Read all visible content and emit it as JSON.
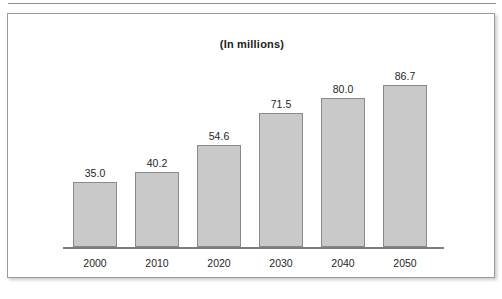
{
  "chart_data": {
    "type": "bar",
    "title": "(In millions)",
    "subtitle": "",
    "xlabel": "",
    "ylabel": "",
    "categories": [
      "2000",
      "2010",
      "2020",
      "2030",
      "2040",
      "2050"
    ],
    "values": [
      35.0,
      40.2,
      54.6,
      71.5,
      80.0,
      86.7
    ],
    "value_labels": [
      "35.0",
      "40.2",
      "54.6",
      "71.5",
      "80.0",
      "86.7"
    ],
    "ylim": [
      0,
      86.7
    ],
    "grid": false,
    "legend": null,
    "axis_visible": {
      "x": true,
      "y": false
    },
    "colors": {
      "bar_fill": "#c9c9c9",
      "bar_border": "#8a8a8a",
      "axis": "#7c7c7c",
      "frame": "#9a9a9a",
      "text": "#262626"
    }
  }
}
